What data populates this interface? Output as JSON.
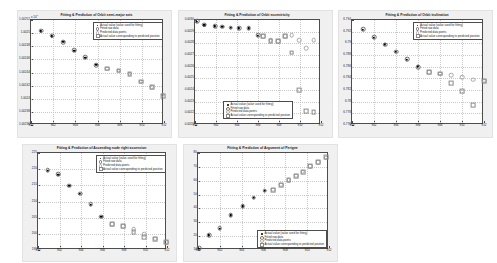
{
  "legend_labels": [
    "Actual value (value used for fitting)",
    "Fitted raw data",
    "Predicted data points",
    "Actual value corresponding to predicted position"
  ],
  "chart_data": [
    {
      "type": "scatter",
      "title": "Fitting & Prediction of Orbit semi-major axis",
      "xlabel": "",
      "ylabel": "",
      "exponent": "x 10",
      "exponent_sup": "7",
      "xlim": [
        900,
        912
      ],
      "ylim": [
        1.00236,
        1.00252
      ],
      "xticks": [
        900,
        902,
        904,
        906,
        908,
        910,
        912
      ],
      "yticks": [
        "1.00252",
        "1.0025",
        "1.00248",
        "1.00246",
        "1.00244",
        "1.00242",
        "1.0024",
        "1.00238",
        "1.00236"
      ],
      "grid": true,
      "legend_position": "top-right",
      "series": [
        {
          "name": "Actual value (value used for fitting)",
          "style": "actual",
          "x": [
            900.9,
            901.9,
            902.9,
            903.9,
            904.9,
            905.9
          ],
          "y": [
            1.002503,
            1.002495,
            1.002487,
            1.002473,
            1.002462,
            1.002452
          ]
        },
        {
          "name": "Fitted raw data",
          "style": "fitted",
          "x": [
            900.9,
            901.9,
            902.9,
            903.9,
            904.9,
            905.9
          ],
          "y": [
            1.002504,
            1.002496,
            1.002486,
            1.002474,
            1.002463,
            1.002451
          ]
        },
        {
          "name": "Predicted data points",
          "style": "pred",
          "x": [
            906.9,
            907.9,
            908.9,
            909.9,
            910.9,
            911.9
          ],
          "y": [
            1.002446,
            1.002443,
            1.002438,
            1.002426,
            1.002418,
            1.002406
          ]
        },
        {
          "name": "Actual value corresponding to predicted position",
          "style": "actpred",
          "x": [
            906.9,
            907.9,
            908.9,
            909.9,
            910.9,
            911.9
          ],
          "y": [
            1.002446,
            1.002443,
            1.002438,
            1.002426,
            1.002418,
            1.002404
          ]
        }
      ]
    },
    {
      "type": "scatter",
      "title": "Fitting & Prediction of Orbit eccentricity",
      "xlabel": "",
      "ylabel": "",
      "exponent": "",
      "exponent_sup": "",
      "xlim": [
        900,
        912
      ],
      "ylim": [
        0.0021,
        0.003
      ],
      "xticks": [
        900,
        902,
        904,
        906,
        908,
        910,
        912
      ],
      "yticks": [
        "0.0030",
        "0.0029",
        "0.0028",
        "0.0027",
        "0.0026",
        "0.0025",
        "0.0024",
        "0.0023",
        "0.0022",
        "0.0021"
      ],
      "grid": true,
      "legend_position": "bottom-center",
      "series": [
        {
          "name": "Actual value (value used for fitting)",
          "style": "actual",
          "x": [
            900.2,
            900.9,
            901.9,
            902.6,
            903.4,
            904.2,
            905.1,
            906.0
          ],
          "y": [
            0.002985,
            0.002955,
            0.002945,
            0.002942,
            0.002932,
            0.00293,
            0.002928,
            0.002865
          ]
        },
        {
          "name": "Fitted raw data",
          "style": "fitted",
          "x": [
            900.2,
            900.9,
            901.9,
            902.6,
            903.4,
            904.2,
            905.1,
            906.0
          ],
          "y": [
            0.00299,
            0.002958,
            0.002948,
            0.002944,
            0.002934,
            0.002932,
            0.00293,
            0.002872
          ]
        },
        {
          "name": "Predicted data points",
          "style": "pred",
          "x": [
            906.5,
            907.2,
            907.9,
            908.6,
            909.2,
            909.9,
            910.6,
            911.3
          ],
          "y": [
            0.002862,
            0.002825,
            0.00282,
            0.002862,
            0.00287,
            0.002828,
            0.00276,
            0.002825
          ]
        },
        {
          "name": "Actual value corresponding to predicted position",
          "style": "actpred",
          "x": [
            906.5,
            907.2,
            907.9,
            908.6,
            909.2,
            909.9,
            910.6,
            911.3
          ],
          "y": [
            0.00286,
            0.002822,
            0.002818,
            0.00286,
            0.00272,
            0.0024,
            0.002218,
            0.002212
          ]
        }
      ]
    },
    {
      "type": "scatter",
      "title": "Fitting & Prediction of Orbit inclination",
      "xlabel": "",
      "ylabel": "",
      "exponent": "",
      "exponent_sup": "",
      "xlim": [
        900,
        912
      ],
      "ylim": [
        6.775,
        6.794
      ],
      "xticks": [
        900,
        902,
        904,
        906,
        908,
        910,
        912
      ],
      "yticks": [
        "6.794",
        "6.792",
        "6.79",
        "6.788",
        "6.786",
        "6.784",
        "6.782",
        "6.78",
        "6.778",
        "6.776"
      ],
      "grid": true,
      "legend_position": "top-right",
      "series": [
        {
          "name": "Actual value (value used for fitting)",
          "style": "actual",
          "x": [
            901.0,
            902.0,
            903.0,
            904.0,
            905.0,
            906.0
          ],
          "y": [
            6.7922,
            6.7908,
            6.7896,
            6.7882,
            6.7868,
            6.7856
          ]
        },
        {
          "name": "Fitted raw data",
          "style": "fitted",
          "x": [
            901.0,
            902.0,
            903.0,
            904.0,
            905.0,
            906.0
          ],
          "y": [
            6.7923,
            6.7909,
            6.7895,
            6.7883,
            6.7869,
            6.7855
          ]
        },
        {
          "name": "Predicted data points",
          "style": "pred",
          "x": [
            907.0,
            908.0,
            909.0,
            910.0,
            911.0,
            912.0
          ],
          "y": [
            6.7846,
            6.7843,
            6.784,
            6.7836,
            6.7832,
            6.783
          ]
        },
        {
          "name": "Actual value corresponding to predicted position",
          "style": "actpred",
          "x": [
            907.0,
            908.0,
            909.0,
            910.0,
            911.0,
            912.0
          ],
          "y": [
            6.7846,
            6.7843,
            6.7826,
            6.7812,
            6.7786,
            6.783
          ]
        }
      ]
    },
    {
      "type": "scatter",
      "title": "Fitting & Prediction of Ascending node right ascension",
      "xlabel": "",
      "ylabel": "",
      "exponent": "",
      "exponent_sup": "",
      "xlim": [
        900,
        912
      ],
      "ylim": [
        195,
        225
      ],
      "xticks": [
        900,
        902,
        904,
        906,
        908,
        910,
        912
      ],
      "yticks": [
        "225",
        "220",
        "215",
        "210",
        "205",
        "200",
        "195"
      ],
      "grid": true,
      "legend_position": "top-right",
      "series": [
        {
          "name": "Actual value (value used for fitting)",
          "style": "actual",
          "x": [
            900.9,
            901.9,
            902.9,
            903.9,
            904.9,
            905.9
          ],
          "y": [
            219.5,
            218.2,
            214.8,
            212.3,
            209.0,
            205.2
          ]
        },
        {
          "name": "Fitted raw data",
          "style": "fitted",
          "x": [
            900.9,
            901.9,
            902.9,
            903.9,
            904.9,
            905.9
          ],
          "y": [
            219.7,
            218.4,
            214.9,
            212.4,
            209.1,
            205.3
          ]
        },
        {
          "name": "Predicted data points",
          "style": "pred",
          "x": [
            906.9,
            907.9,
            908.9,
            909.9,
            910.9,
            911.9
          ],
          "y": [
            203.0,
            202.3,
            201.5,
            199.8,
            198.5,
            197.5
          ]
        },
        {
          "name": "Actual value corresponding to predicted position",
          "style": "actpred",
          "x": [
            906.9,
            907.9,
            908.9,
            909.9,
            910.9,
            911.9
          ],
          "y": [
            203.0,
            202.4,
            200.6,
            199.0,
            198.4,
            197.4
          ]
        }
      ]
    },
    {
      "type": "scatter",
      "title": "Fitting & Prediction of Argument of Perigee",
      "xlabel": "",
      "ylabel": "",
      "exponent": "",
      "exponent_sup": "",
      "xlim": [
        900,
        912
      ],
      "ylim": [
        10,
        80
      ],
      "xticks": [
        900,
        902,
        904,
        906,
        908,
        910,
        912
      ],
      "yticks": [
        "80",
        "70",
        "60",
        "50",
        "40",
        "30",
        "20",
        "10"
      ],
      "grid": true,
      "legend_position": "bottom-right",
      "series": [
        {
          "name": "Actual value (value used for fitting)",
          "style": "actual",
          "x": [
            900.1,
            901.0,
            902.0,
            903.0,
            904.1,
            905.1,
            906.1
          ],
          "y": [
            11.0,
            20.5,
            25.5,
            35.0,
            41.5,
            47.5,
            52.5
          ]
        },
        {
          "name": "Fitted raw data",
          "style": "fitted",
          "x": [
            900.1,
            901.0,
            902.0,
            903.0,
            904.1,
            905.1,
            906.1
          ],
          "y": [
            11.2,
            20.7,
            25.7,
            35.2,
            41.7,
            47.7,
            52.7
          ]
        },
        {
          "name": "Predicted data points",
          "style": "pred",
          "x": [
            906.9,
            907.6,
            908.3,
            909.0,
            909.6,
            910.3,
            911.0,
            911.7
          ],
          "y": [
            53.5,
            57.0,
            60.5,
            63.5,
            66.5,
            70.5,
            73.5,
            76.5
          ]
        },
        {
          "name": "Actual value corresponding to predicted position",
          "style": "actpred",
          "x": [
            906.9,
            907.6,
            908.3,
            909.0,
            909.6,
            910.3,
            911.0,
            911.7
          ],
          "y": [
            53.5,
            57.0,
            60.3,
            63.3,
            66.3,
            70.3,
            73.3,
            77.0
          ]
        }
      ]
    }
  ]
}
